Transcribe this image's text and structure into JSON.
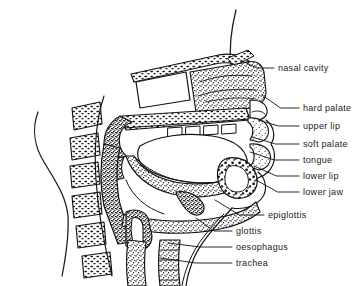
{
  "figure": {
    "background_color": "#ffffff",
    "ink_color": "#111111",
    "label_color": "#1a1a1a",
    "width": 362,
    "height": 286
  },
  "labels": [
    {
      "id": "nasal-cavity",
      "text": "nasal cavity",
      "x": 278,
      "y": 64,
      "leader": {
        "x1": 274,
        "y1": 68,
        "x2": 240,
        "y2": 60
      }
    },
    {
      "id": "hard-palate",
      "text": "hard palate",
      "x": 303,
      "y": 104,
      "leader": {
        "x1": 299,
        "y1": 108,
        "x2": 262,
        "y2": 95
      }
    },
    {
      "id": "upper-lip",
      "text": "upper lip",
      "x": 303,
      "y": 122,
      "leader": {
        "x1": 299,
        "y1": 126,
        "x2": 258,
        "y2": 120
      }
    },
    {
      "id": "soft-palate",
      "text": "soft palate",
      "x": 303,
      "y": 140,
      "leader": {
        "x1": 299,
        "y1": 144,
        "x2": 252,
        "y2": 137
      }
    },
    {
      "id": "tongue",
      "text": "tongue",
      "x": 303,
      "y": 156,
      "leader": {
        "x1": 299,
        "y1": 160,
        "x2": 250,
        "y2": 152
      }
    },
    {
      "id": "lower-lip",
      "text": "lower lip",
      "x": 303,
      "y": 172,
      "leader": {
        "x1": 299,
        "y1": 176,
        "x2": 254,
        "y2": 166
      }
    },
    {
      "id": "lower-jaw",
      "text": "lower jaw",
      "x": 303,
      "y": 188,
      "leader": {
        "x1": 299,
        "y1": 192,
        "x2": 256,
        "y2": 180
      }
    },
    {
      "id": "epiglottis",
      "text": "epiglottis",
      "x": 268,
      "y": 211,
      "leader": {
        "x1": 264,
        "y1": 215,
        "x2": 215,
        "y2": 200
      }
    },
    {
      "id": "glottis",
      "text": "glottis",
      "x": 236,
      "y": 227,
      "leader": {
        "x1": 232,
        "y1": 231,
        "x2": 196,
        "y2": 218
      }
    },
    {
      "id": "oesophagus",
      "text": "oesophagus",
      "x": 236,
      "y": 243,
      "leader": {
        "x1": 232,
        "y1": 247,
        "x2": 168,
        "y2": 243
      }
    },
    {
      "id": "trachea",
      "text": "trachea",
      "x": 236,
      "y": 259,
      "leader": {
        "x1": 232,
        "y1": 263,
        "x2": 160,
        "y2": 258
      }
    }
  ],
  "anatomy": {
    "regions": [
      {
        "id": "nasal-cavity-void",
        "name": "nasal cavity",
        "fill": "none"
      },
      {
        "id": "hard-palate-bone",
        "name": "hard palate",
        "fill": "hatched"
      },
      {
        "id": "soft-palate-tissue",
        "name": "soft palate",
        "fill": "stipple"
      },
      {
        "id": "tongue-body",
        "name": "tongue",
        "fill": "stipple"
      },
      {
        "id": "oral-cavity-void",
        "name": "oral cavity",
        "fill": "none"
      },
      {
        "id": "upper-lip-tissue",
        "name": "upper lip",
        "fill": "stipple"
      },
      {
        "id": "lower-lip-tissue",
        "name": "lower lip",
        "fill": "stipple"
      },
      {
        "id": "lower-jaw-bone",
        "name": "lower jaw",
        "fill": "speckled"
      },
      {
        "id": "epiglottis-flap",
        "name": "epiglottis",
        "fill": "stipple"
      },
      {
        "id": "glottis-opening",
        "name": "glottis",
        "fill": "none"
      },
      {
        "id": "oesophagus-tube",
        "name": "oesophagus",
        "fill": "stipple"
      },
      {
        "id": "trachea-tube",
        "name": "trachea",
        "fill": "stipple"
      },
      {
        "id": "vertebral-column",
        "name": "vertebrae",
        "fill": "hatched"
      },
      {
        "id": "face-profile",
        "name": "face profile outline",
        "fill": "none"
      }
    ]
  }
}
